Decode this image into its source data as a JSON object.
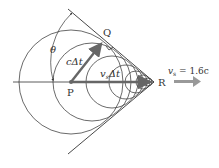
{
  "diagram": {
    "type": "shock-wave (Cherenkov cone) geometry",
    "labels": {
      "theta": "θ",
      "Q": "Q",
      "P": "P",
      "R": "R",
      "c_dt": "cΔt",
      "vs_dt_v": "v",
      "vs_dt_sub": "s",
      "vs_dt_rest": "Δt",
      "speed_v": "v",
      "speed_sub": "s",
      "speed_rest": " = 1.6c"
    },
    "colors": {
      "line": "#333333",
      "vector": "#666666",
      "arrow": "#888888",
      "circle": "#444444"
    }
  }
}
